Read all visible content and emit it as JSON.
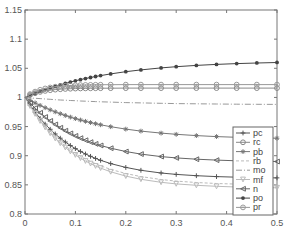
{
  "chart_data": {
    "type": "line",
    "title": "",
    "xlabel": "",
    "ylabel": "",
    "xlim": [
      0,
      0.5
    ],
    "ylim": [
      0.8,
      1.15
    ],
    "xticks": [
      0,
      0.1,
      0.2,
      0.3,
      0.4,
      0.5
    ],
    "xtick_labels": [
      "0",
      "0.1",
      "0.2",
      "0.3",
      "0.4",
      "0.5"
    ],
    "yticks": [
      0.8,
      0.85,
      0.9,
      0.95,
      1,
      1.05,
      1.1,
      1.15
    ],
    "ytick_labels": [
      "0.8",
      "0.85",
      "0.9",
      "0.95",
      "1",
      "1.05",
      "1.1",
      "1.15"
    ],
    "grid": false,
    "legend_position": "bottom-right",
    "x": [
      0,
      0.01,
      0.02,
      0.03,
      0.04,
      0.05,
      0.06,
      0.07,
      0.08,
      0.09,
      0.1,
      0.11,
      0.12,
      0.13,
      0.14,
      0.15,
      0.17,
      0.2,
      0.23,
      0.27,
      0.3,
      0.34,
      0.38,
      0.42,
      0.46,
      0.5
    ],
    "series": [
      {
        "name": "pc",
        "marker": "plus",
        "color": "#555555",
        "dash": "",
        "end": 0.862,
        "rate": 10
      },
      {
        "name": "rc",
        "marker": "circle",
        "color": "#888888",
        "dash": "",
        "end": 1.016,
        "rate": 30
      },
      {
        "name": "pb",
        "marker": "star",
        "color": "#777777",
        "dash": "",
        "end": 0.93,
        "rate": 7
      },
      {
        "name": "rb",
        "marker": "none",
        "color": "#bbbbbb",
        "dash": "3,2",
        "end": 0.85,
        "rate": 10
      },
      {
        "name": "mo",
        "marker": "none",
        "color": "#999999",
        "dash": "6,2,1,2",
        "end": 0.988,
        "rate": 6
      },
      {
        "name": "mf",
        "marker": "triangle-down",
        "color": "#bbbbbb",
        "dash": "",
        "end": 0.845,
        "rate": 10
      },
      {
        "name": "n",
        "marker": "triangle-left",
        "color": "#666666",
        "dash": "",
        "end": 0.89,
        "rate": 9
      },
      {
        "name": "po",
        "marker": "filled-dot",
        "color": "#444444",
        "dash": "",
        "end": 1.06,
        "rate": 6
      },
      {
        "name": "pr",
        "marker": "circle-dot",
        "color": "#999999",
        "dash": "",
        "end": 1.022,
        "rate": 30
      }
    ]
  }
}
